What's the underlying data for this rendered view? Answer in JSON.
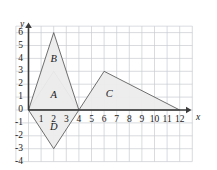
{
  "figure": {
    "background_color": "#ffffff",
    "grid_color": "#c9ccd1",
    "axis_color": "#3b3b3b",
    "shape_fill_color": "#ececec",
    "shape_stroke_color": "#5f5f5f"
  },
  "chart_data": {
    "type": "scatter",
    "title": "",
    "xlabel": "x",
    "ylabel": "y",
    "xlim": [
      -1,
      13
    ],
    "ylim": [
      -4,
      6.5
    ],
    "grid": true,
    "grid_step_x": 1,
    "grid_step_y": 1,
    "legend": "none",
    "x_tick_labels": [
      "1",
      "2",
      "3",
      "4",
      "5",
      "6",
      "7",
      "8",
      "9",
      "10",
      "11",
      "12"
    ],
    "x_tick_values": [
      1,
      2,
      3,
      4,
      5,
      6,
      7,
      8,
      9,
      10,
      11,
      12
    ],
    "y_tick_labels": [
      "6",
      "5",
      "4",
      "3",
      "2",
      "1",
      "0",
      "-1",
      "-2",
      "-3",
      "-4"
    ],
    "y_tick_values": [
      6,
      5,
      4,
      3,
      2,
      1,
      0,
      -1,
      -2,
      -3,
      -4
    ],
    "series": [
      {
        "name": "A",
        "label": "A",
        "label_position": [
          2,
          1.1
        ],
        "shape": "triangle",
        "points": [
          [
            0,
            0
          ],
          [
            2,
            3
          ],
          [
            4,
            0
          ]
        ]
      },
      {
        "name": "B",
        "label": "B",
        "label_position": [
          2,
          3.9
        ],
        "shape": "triangle",
        "points": [
          [
            0,
            0
          ],
          [
            2,
            6
          ],
          [
            4,
            0
          ]
        ]
      },
      {
        "name": "C",
        "label": "C",
        "label_position": [
          6.4,
          1.2
        ],
        "shape": "triangle",
        "points": [
          [
            4,
            0
          ],
          [
            6,
            3
          ],
          [
            12,
            0
          ]
        ]
      },
      {
        "name": "D",
        "label": "D",
        "label_position": [
          2,
          -1.35
        ],
        "shape": "triangle",
        "points": [
          [
            0,
            0
          ],
          [
            2,
            -3
          ],
          [
            4,
            0
          ]
        ]
      }
    ]
  },
  "axes": {
    "x_axis_name": "x",
    "y_axis_name": "y"
  }
}
